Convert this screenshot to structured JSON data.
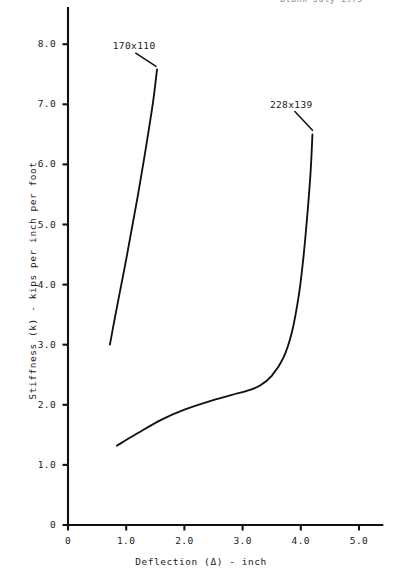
{
  "header": {
    "fragment_text": "Blank July 1975"
  },
  "chart_data": {
    "type": "line",
    "title": "",
    "subtitle": "",
    "xlabel": "Deflection (Δ) - inch",
    "ylabel": "Stiffness (k) - kips per inch per foot",
    "xlim": [
      0,
      5.4
    ],
    "ylim": [
      0,
      8.6
    ],
    "grid": false,
    "legend_position": "inline-annotation",
    "xticks": [
      {
        "value": 0,
        "label": "0"
      },
      {
        "value": 1.0,
        "label": "1.0"
      },
      {
        "value": 2.0,
        "label": "2.0"
      },
      {
        "value": 3.0,
        "label": "3.0"
      },
      {
        "value": 4.0,
        "label": "4.0"
      },
      {
        "value": 5.0,
        "label": "5.0"
      }
    ],
    "yticks": [
      {
        "value": 0,
        "label": "0"
      },
      {
        "value": 1.0,
        "label": "1.0"
      },
      {
        "value": 2.0,
        "label": "2.0"
      },
      {
        "value": 3.0,
        "label": "3.0"
      },
      {
        "value": 4.0,
        "label": "4.0"
      },
      {
        "value": 5.0,
        "label": "5.0"
      },
      {
        "value": 6.0,
        "label": "6.0"
      },
      {
        "value": 7.0,
        "label": "7.0"
      },
      {
        "value": 8.0,
        "label": "8.0"
      }
    ],
    "series": [
      {
        "name": "170x110",
        "label": "170x110",
        "color": "#111111",
        "label_x": 1.25,
        "label_y": 7.95,
        "points": [
          {
            "x": 0.72,
            "y": 3.0
          },
          {
            "x": 0.8,
            "y": 3.42
          },
          {
            "x": 0.9,
            "y": 3.92
          },
          {
            "x": 1.0,
            "y": 4.42
          },
          {
            "x": 1.1,
            "y": 4.95
          },
          {
            "x": 1.2,
            "y": 5.48
          },
          {
            "x": 1.3,
            "y": 6.05
          },
          {
            "x": 1.4,
            "y": 6.65
          },
          {
            "x": 1.47,
            "y": 7.1
          },
          {
            "x": 1.53,
            "y": 7.58
          }
        ]
      },
      {
        "name": "228x139",
        "label": "228x139",
        "color": "#111111",
        "label_x": 3.95,
        "label_y": 6.98,
        "points": [
          {
            "x": 0.84,
            "y": 1.32
          },
          {
            "x": 1.2,
            "y": 1.53
          },
          {
            "x": 1.6,
            "y": 1.75
          },
          {
            "x": 2.0,
            "y": 1.92
          },
          {
            "x": 2.4,
            "y": 2.05
          },
          {
            "x": 2.8,
            "y": 2.16
          },
          {
            "x": 3.1,
            "y": 2.24
          },
          {
            "x": 3.3,
            "y": 2.32
          },
          {
            "x": 3.5,
            "y": 2.48
          },
          {
            "x": 3.7,
            "y": 2.78
          },
          {
            "x": 3.85,
            "y": 3.22
          },
          {
            "x": 3.97,
            "y": 3.85
          },
          {
            "x": 4.05,
            "y": 4.5
          },
          {
            "x": 4.12,
            "y": 5.25
          },
          {
            "x": 4.17,
            "y": 5.9
          },
          {
            "x": 4.2,
            "y": 6.5
          }
        ]
      }
    ]
  }
}
